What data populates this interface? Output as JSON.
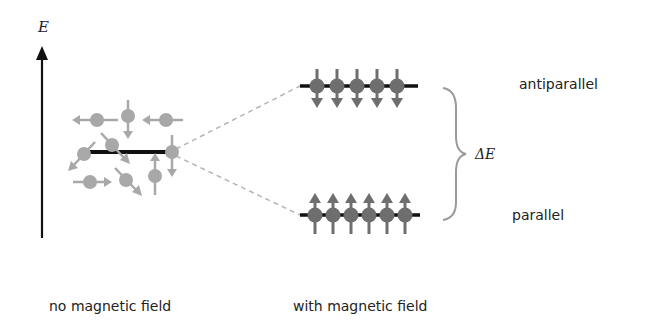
{
  "diagram": {
    "axis_label": "E",
    "delta_label": "ΔE",
    "upper_level_label": "antiparallel",
    "lower_level_label": "parallel",
    "left_caption": "no magnetic field",
    "right_caption": "with magnetic field",
    "upper_level_spin_count": 5,
    "lower_level_spin_count": 6,
    "upper_spin_direction": "down",
    "lower_spin_direction": "up",
    "colors": {
      "axis": "#111111",
      "level_line": "#111111",
      "random_spin": "#a8a8a8",
      "aligned_spin": "#6e6e6e",
      "dashed_connector": "#b5b5b5",
      "brace": "#9a9a9a",
      "text": "#222222"
    }
  }
}
